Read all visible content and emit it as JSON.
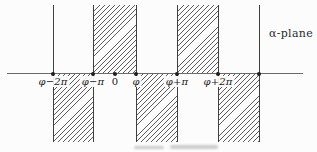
{
  "figure": {
    "plane_label": "α-plane",
    "axis": {
      "y": 73,
      "x1": 7,
      "x2": 303
    },
    "band": {
      "top": 5,
      "bottom": 142
    },
    "ticks": [
      {
        "label": "φ−2π",
        "x": 53
      },
      {
        "label": "φ−π",
        "x": 93
      },
      {
        "label": "0",
        "x": 115
      },
      {
        "label": "φ",
        "x": 136
      },
      {
        "label": "φ+π",
        "x": 177
      },
      {
        "label": "φ+2π",
        "x": 218
      }
    ],
    "dots_x": [
      53,
      93,
      115,
      136,
      177,
      218,
      259
    ],
    "hatched_strips": [
      {
        "interval": "[φ−π, φ]",
        "side": "above",
        "x1": 93,
        "x2": 136
      },
      {
        "interval": "[φ+π, φ+2π]",
        "side": "above",
        "x1": 177,
        "x2": 218
      },
      {
        "interval": "[φ−2π, φ−π]",
        "side": "below",
        "x1": 53,
        "x2": 93
      },
      {
        "interval": "[φ, φ+π]",
        "side": "below",
        "x1": 136,
        "x2": 177
      },
      {
        "interval": "[φ+2π, φ+3π]",
        "side": "below",
        "x1": 218,
        "x2": 259
      }
    ],
    "boundary_lines": [
      {
        "x": 53,
        "side": "above"
      },
      {
        "x": 259,
        "side": "above"
      }
    ],
    "colors": {
      "axis": "#6a6a6a",
      "lines": "#3f3f3f",
      "hatch": "#3e3e3e",
      "text": "#222222",
      "background": "#fcfcfc"
    }
  }
}
